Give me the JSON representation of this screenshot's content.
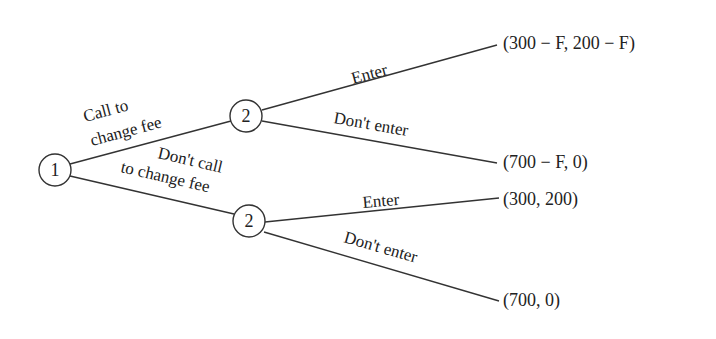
{
  "diagram": {
    "type": "game-tree",
    "nodes": [
      {
        "id": "root",
        "label": "1"
      },
      {
        "id": "upper",
        "label": "2"
      },
      {
        "id": "lower",
        "label": "2"
      }
    ],
    "branches": {
      "root_to_upper": {
        "line1": "Call to",
        "line2": "change fee"
      },
      "root_to_lower": {
        "line1": "Don't call",
        "line2": "to change fee"
      },
      "upper_enter": "Enter",
      "upper_dont_enter": "Don't enter",
      "lower_enter": "Enter",
      "lower_dont_enter": "Don't enter"
    },
    "payoffs": {
      "upper_enter": "(300 − F, 200 − F)",
      "upper_dont_enter": "(700 − F, 0)",
      "lower_enter": "(300, 200)",
      "lower_dont_enter": "(700, 0)"
    }
  }
}
